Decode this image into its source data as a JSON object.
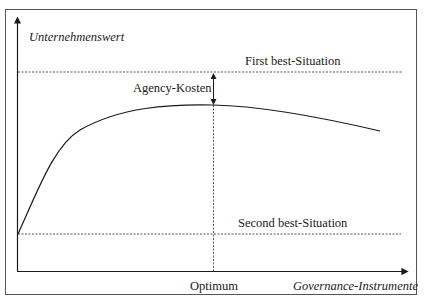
{
  "diagram": {
    "y_axis_label": "Unternehmenswert",
    "x_axis_label": "Governance-Instrumente",
    "first_best_label": "First best-Situation",
    "second_best_label": "Second best-Situation",
    "agency_cost_label": "Agency-Kosten",
    "optimum_label": "Optimum"
  },
  "colors": {
    "line": "#1a1a1a",
    "dashed": "#555555",
    "frame": "#555555"
  }
}
